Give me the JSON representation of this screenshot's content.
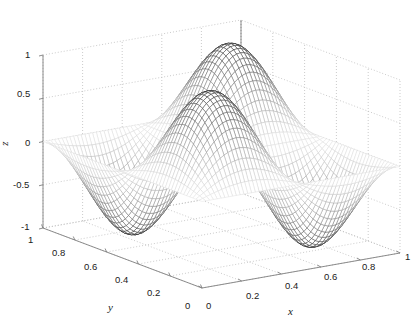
{
  "figure": {
    "background_color": "#ffffff",
    "axis_line_color": "#808080",
    "grid_color": "#b4b4b4",
    "mesh_dark_color": "#141414",
    "mesh_light_color": "#d2d2d2",
    "text_color": "#1a1a1a"
  },
  "chart_data": {
    "type": "surface",
    "title": "",
    "subtitle": "",
    "xlabel": "x",
    "ylabel": "y",
    "zlabel": "z",
    "xlim": [
      0,
      1
    ],
    "ylim": [
      0,
      1
    ],
    "zlim": [
      -1,
      1
    ],
    "xticks": [
      0,
      0.2,
      0.4,
      0.6,
      0.8,
      1
    ],
    "yticks": [
      0,
      0.2,
      0.4,
      0.6,
      0.8,
      1
    ],
    "zticks": [
      -1,
      -0.5,
      0,
      0.5,
      1
    ],
    "xtick_labels": [
      "0",
      "0.2",
      "0.4",
      "0.6",
      "0.8",
      "1"
    ],
    "ytick_labels": [
      "0",
      "0.2",
      "0.4",
      "0.6",
      "0.8",
      "1"
    ],
    "ztick_labels": [
      "-1",
      "-0.5",
      "0",
      "0.5",
      "1"
    ],
    "grid": true,
    "legend": false,
    "colormap": "gray",
    "shading": "mesh-wireframe",
    "surface_formula": "z = sin(2*pi*x) * sin(2*pi*y)",
    "mesh_resolution": 52,
    "view_azimuth": -37.5,
    "view_elevation": 30,
    "peaks": [
      {
        "x": 0.25,
        "y": 0.25,
        "z": 1
      },
      {
        "x": 0.75,
        "y": 0.75,
        "z": 1
      }
    ],
    "valleys": [
      {
        "x": 0.25,
        "y": 0.75,
        "z": -1
      },
      {
        "x": 0.75,
        "y": 0.25,
        "z": -1
      }
    ]
  },
  "axes": {
    "z": {
      "title": "z",
      "ticks": [
        {
          "label": "1",
          "value": 1
        },
        {
          "label": "0.5",
          "value": 0.5
        },
        {
          "label": "0",
          "value": 0
        },
        {
          "label": "-0.5",
          "value": -0.5
        },
        {
          "label": "-1",
          "value": -1
        }
      ]
    },
    "y": {
      "title": "y",
      "ticks": [
        {
          "label": "1",
          "value": 1
        },
        {
          "label": "0.8",
          "value": 0.8
        },
        {
          "label": "0.6",
          "value": 0.6
        },
        {
          "label": "0.4",
          "value": 0.4
        },
        {
          "label": "0.2",
          "value": 0.2
        },
        {
          "label": "0",
          "value": 0
        }
      ]
    },
    "x": {
      "title": "x",
      "ticks": [
        {
          "label": "0",
          "value": 0
        },
        {
          "label": "0.2",
          "value": 0.2
        },
        {
          "label": "0.4",
          "value": 0.4
        },
        {
          "label": "0.6",
          "value": 0.6
        },
        {
          "label": "0.8",
          "value": 0.8
        },
        {
          "label": "1",
          "value": 1
        }
      ]
    }
  }
}
